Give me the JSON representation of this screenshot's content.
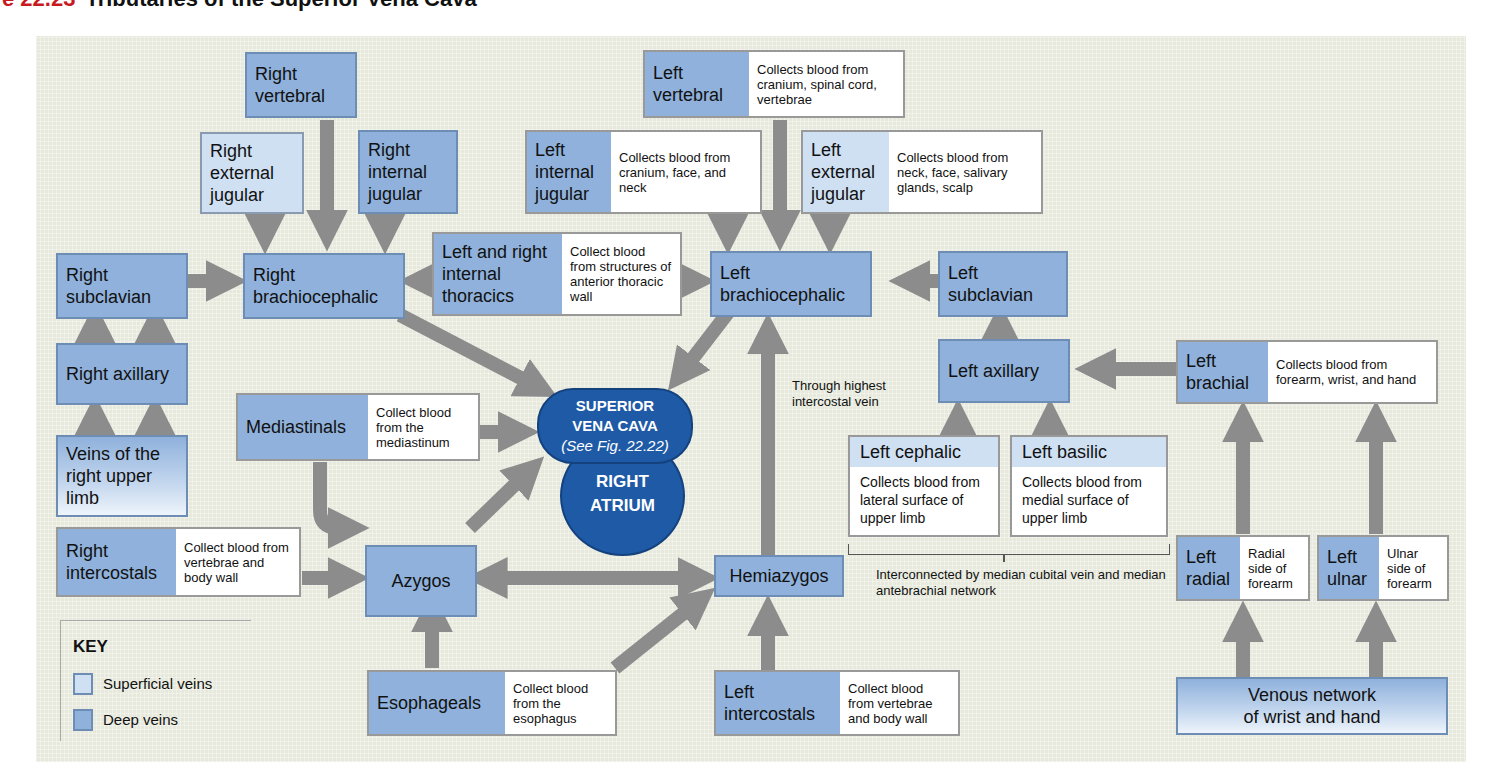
{
  "title": {
    "figure": "ure 22.23",
    "text": "Tributaries of the Superior Vena Cava"
  },
  "colors": {
    "deep_vein": "#8fb1dc",
    "superficial_vein": "#cfe0f3",
    "heart_chamber": "#1f5aa6",
    "arrow": "#8c8c8c",
    "panel": "#e6e9dc",
    "figure_label": "#c8191f"
  },
  "veins": {
    "right_vertebral": {
      "name": "Right vertebral"
    },
    "right_external_jugular": {
      "name": "Right external jugular"
    },
    "right_internal_jugular": {
      "name": "Right internal jugular"
    },
    "right_subclavian": {
      "name": "Right subclavian"
    },
    "right_brachiocephalic": {
      "name": "Right brachiocephalic"
    },
    "right_axillary": {
      "name": "Right axillary"
    },
    "veins_right_upper_limb": {
      "name": "Veins of the right upper limb"
    },
    "right_intercostals": {
      "name": "Right intercostals",
      "desc": "Collect blood from vertebrae and body wall"
    },
    "internal_thoracics": {
      "name": "Left and right internal thoracics",
      "desc": "Collect blood from structures of anterior thoracic wall"
    },
    "mediastinals": {
      "name": "Mediastinals",
      "desc": "Collect blood from the mediastinum"
    },
    "azygos": {
      "name": "Azygos"
    },
    "esophageals": {
      "name": "Esophageals",
      "desc": "Collect blood from the esophagus"
    },
    "left_vertebral": {
      "name": "Left vertebral",
      "desc": "Collects blood from cranium, spinal cord, vertebrae"
    },
    "left_internal_jugular": {
      "name": "Left internal jugular",
      "desc": "Collects blood from cranium, face, and neck"
    },
    "left_external_jugular": {
      "name": "Left external jugular",
      "desc": "Collects blood from neck, face, salivary glands, scalp"
    },
    "left_brachiocephalic": {
      "name": "Left brachiocephalic"
    },
    "left_subclavian": {
      "name": "Left subclavian"
    },
    "left_axillary": {
      "name": "Left axillary"
    },
    "left_brachial": {
      "name": "Left brachial",
      "desc": "Collects blood from forearm, wrist, and hand"
    },
    "left_cephalic": {
      "name": "Left cephalic",
      "desc": "Collects blood from lateral surface of upper limb"
    },
    "left_basilic": {
      "name": "Left basilic",
      "desc": "Collects blood from medial surface of upper limb"
    },
    "left_radial": {
      "name": "Left radial",
      "desc": "Radial side of forearm"
    },
    "left_ulnar": {
      "name": "Left ulnar",
      "desc": "Ulnar side of forearm"
    },
    "hemiazygos": {
      "name": "Hemiazygos"
    },
    "left_intercostals": {
      "name": "Left intercostals",
      "desc": "Collect blood from vertebrae and body wall"
    },
    "venous_network": {
      "name": "Venous network of wrist and hand"
    }
  },
  "svc": {
    "line1": "SUPERIOR",
    "line2": "VENA CAVA",
    "note": "(See Fig. 22.22)"
  },
  "right_atrium": {
    "line1": "RIGHT",
    "line2": "ATRIUM"
  },
  "annotations": {
    "highest_intercostal": "Through highest intercostal vein",
    "interconnected": "Interconnected by median cubital vein and median antebrachial network"
  },
  "key": {
    "title": "KEY",
    "items": [
      {
        "label": "Superficial veins",
        "color": "#cfe0f3"
      },
      {
        "label": "Deep veins",
        "color": "#8fb1dc"
      }
    ]
  }
}
